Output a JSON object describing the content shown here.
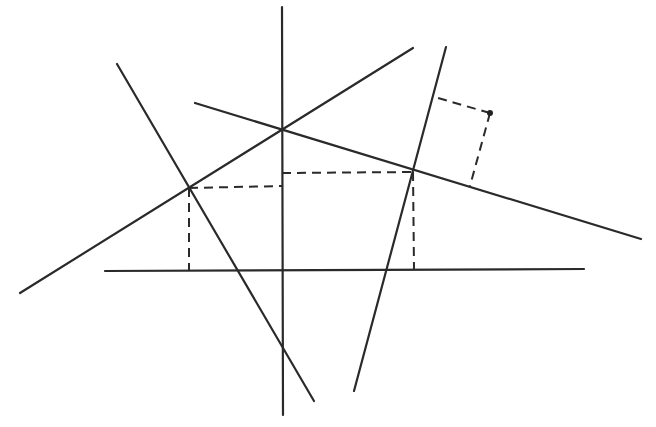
{
  "diagram": {
    "type": "geometric-construction",
    "colors": {
      "line": "#2a2a2a",
      "background": "#ffffff"
    },
    "solid_lines": [
      {
        "id": "vertical-axis",
        "x1": 282,
        "y1": 7,
        "x2": 283,
        "y2": 415
      },
      {
        "id": "horizontal-base",
        "x1": 105,
        "y1": 271,
        "x2": 584,
        "y2": 269
      },
      {
        "id": "steep-left",
        "x1": 117,
        "y1": 64,
        "x2": 314,
        "y2": 401
      },
      {
        "id": "rising-diagonal",
        "x1": 20,
        "y1": 293,
        "x2": 413,
        "y2": 48
      },
      {
        "id": "falling-diagonal",
        "x1": 195,
        "y1": 103,
        "x2": 641,
        "y2": 239
      },
      {
        "id": "steep-right",
        "x1": 446,
        "y1": 47,
        "x2": 354,
        "y2": 391
      }
    ],
    "dashed_lines": [
      {
        "id": "left-horizontal-projection",
        "x1": 189,
        "y1": 188,
        "x2": 282,
        "y2": 186
      },
      {
        "id": "left-vertical-projection",
        "x1": 189,
        "y1": 188,
        "x2": 189,
        "y2": 271
      },
      {
        "id": "right-horizontal-projection",
        "x1": 282,
        "y1": 173,
        "x2": 413,
        "y2": 172
      },
      {
        "id": "right-vertical-projection",
        "x1": 413,
        "y1": 172,
        "x2": 414,
        "y2": 269
      },
      {
        "id": "free-point-to-steep-right",
        "x1": 490,
        "y1": 113,
        "x2": 438,
        "y2": 98
      },
      {
        "id": "free-point-to-falling-diagonal",
        "x1": 490,
        "y1": 113,
        "x2": 470,
        "y2": 186
      }
    ],
    "points": [
      {
        "id": "free-point",
        "x": 490,
        "y": 113
      }
    ]
  }
}
